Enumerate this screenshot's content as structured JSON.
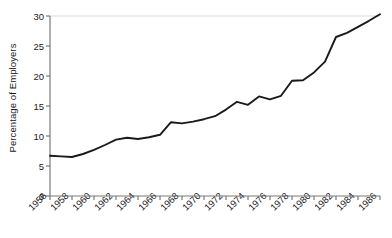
{
  "chart_data": {
    "type": "line",
    "title": "",
    "xlabel": "",
    "ylabel": "Percentage of Employers",
    "xlim": [
      1956,
      1986
    ],
    "ylim": [
      0,
      30
    ],
    "grid": false,
    "legend": null,
    "y_ticks": [
      0,
      5,
      10,
      15,
      20,
      25,
      30
    ],
    "y_tick_labels": [
      "0",
      "5",
      "10",
      "15",
      "20",
      "25",
      "30"
    ],
    "x_ticks": [
      1956,
      1958,
      1960,
      1962,
      1964,
      1966,
      1968,
      1970,
      1972,
      1974,
      1976,
      1978,
      1980,
      1982,
      1984,
      1986
    ],
    "x_tick_labels": [
      "1956",
      "1958",
      "1960",
      "1962",
      "1964",
      "1966",
      "1968",
      "1970",
      "1972",
      "1974",
      "1976",
      "1978",
      "1980",
      "1982",
      "1984",
      "1986"
    ],
    "line_color": "#1a1a1a",
    "top_gridline_color": "#d9d9d9",
    "axis_color": "#808080",
    "x": [
      1956,
      1957,
      1958,
      1959,
      1960,
      1961,
      1962,
      1963,
      1964,
      1965,
      1966,
      1967,
      1968,
      1969,
      1970,
      1971,
      1972,
      1973,
      1974,
      1975,
      1976,
      1977,
      1978,
      1979,
      1980,
      1981,
      1982,
      1983,
      1984,
      1985,
      1986
    ],
    "values": [
      6.7,
      6.6,
      6.5,
      7.0,
      7.7,
      8.5,
      9.4,
      9.7,
      9.5,
      9.8,
      10.2,
      12.3,
      12.1,
      12.4,
      12.8,
      13.3,
      14.4,
      15.7,
      15.2,
      16.6,
      16.1,
      16.7,
      19.2,
      19.3,
      20.6,
      22.4,
      26.5,
      27.2,
      28.2,
      29.2,
      30.3
    ],
    "series_name": "Percentage of Employers"
  }
}
